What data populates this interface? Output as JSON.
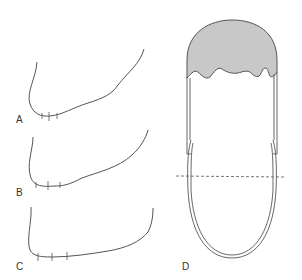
{
  "figure": {
    "panels": [
      {
        "id": "A",
        "label": "A",
        "description": "curved outline with three tick marks near lowest point"
      },
      {
        "id": "B",
        "label": "B",
        "description": "curved outline with three tick marks near lowest point"
      },
      {
        "id": "C",
        "label": "C",
        "description": "curved outline with three tick marks near lowest point"
      },
      {
        "id": "D",
        "label": "D",
        "description": "elongated U-shaped tube with shaded dome cap and dashed horizontal line"
      }
    ],
    "colors": {
      "stroke": "#555555",
      "fill_shaded": "#c8c8c8",
      "dashed_line": "#666666",
      "label": "#333333",
      "background": "#ffffff"
    }
  }
}
